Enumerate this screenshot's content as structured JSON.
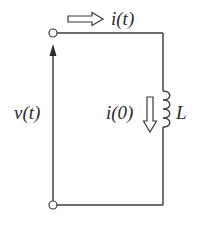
{
  "diagram": {
    "type": "circuit",
    "labels": {
      "current": "i(t)",
      "voltage": "v(t)",
      "initial_current": "i(0)",
      "inductor": "L"
    },
    "components": [
      {
        "id": "terminal-top",
        "kind": "terminal"
      },
      {
        "id": "terminal-bottom",
        "kind": "terminal"
      },
      {
        "id": "inductor",
        "kind": "inductor",
        "label": "L"
      }
    ],
    "colors": {
      "stroke": "#3a3a3a",
      "text": "#2a2a2a",
      "background": "#ffffff"
    }
  }
}
